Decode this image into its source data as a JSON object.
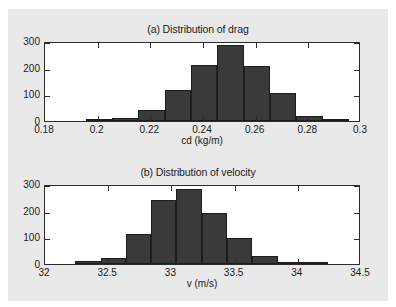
{
  "figure": {
    "background_color": "#e9e9e9",
    "bar_color": "#3a3a3a",
    "axis_color": "#2b2b2b"
  },
  "chart_data": [
    {
      "type": "bar",
      "id": "drag",
      "title": "(a) Distribution of drag",
      "xlabel": "cd (kg/m)",
      "ylabel": "",
      "xlim": [
        0.18,
        0.3
      ],
      "ylim": [
        0,
        300
      ],
      "xticks": [
        0.18,
        0.2,
        0.22,
        0.24,
        0.26,
        0.28,
        0.3
      ],
      "xticklabels": [
        "0.18",
        "0.2",
        "0.22",
        "0.24",
        "0.26",
        "0.28",
        "0.3"
      ],
      "yticks": [
        0,
        100,
        200,
        300
      ],
      "yticklabels": [
        "0",
        "100",
        "200",
        "300"
      ],
      "grid": false,
      "legend": null,
      "bin_edges": [
        0.1955,
        0.2055,
        0.2155,
        0.2255,
        0.2355,
        0.2455,
        0.2555,
        0.2655,
        0.2755,
        0.2855,
        0.2955
      ],
      "bin_centers": [
        0.2005,
        0.2105,
        0.2205,
        0.2305,
        0.2405,
        0.2505,
        0.2605,
        0.2705,
        0.2805,
        0.2905
      ],
      "values": [
        5,
        12,
        43,
        118,
        209,
        284,
        206,
        104,
        17,
        7
      ]
    },
    {
      "type": "bar",
      "id": "velocity",
      "title": "(b) Distribution of velocity",
      "xlabel": "v (m/s)",
      "ylabel": "",
      "xlim": [
        32,
        34.5
      ],
      "ylim": [
        0,
        300
      ],
      "xticks": [
        32,
        32.5,
        33,
        33.5,
        34,
        34.5
      ],
      "xticklabels": [
        "32",
        "32.5",
        "33",
        "33.5",
        "34",
        "34.5"
      ],
      "yticks": [
        0,
        100,
        200,
        300
      ],
      "yticklabels": [
        "0",
        "100",
        "200",
        "300"
      ],
      "grid": false,
      "legend": null,
      "bin_edges": [
        32.24,
        32.44,
        32.64,
        32.84,
        33.04,
        33.24,
        33.44,
        33.64,
        33.84,
        34.04,
        34.24
      ],
      "bin_centers": [
        32.34,
        32.54,
        32.74,
        32.94,
        33.14,
        33.34,
        33.54,
        33.74,
        33.94,
        34.14
      ],
      "values": [
        10,
        24,
        114,
        240,
        280,
        190,
        97,
        30,
        8,
        2
      ]
    }
  ]
}
